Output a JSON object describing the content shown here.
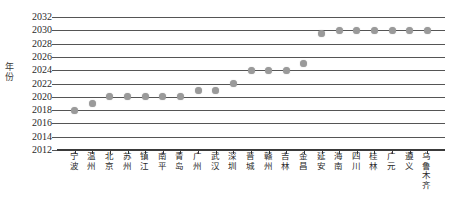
{
  "chart_data": {
    "type": "scatter",
    "title": "",
    "xlabel": "",
    "ylabel": "年份",
    "ylim": [
      2012,
      2032
    ],
    "ytick_labels": [
      "2032",
      "2030",
      "2028",
      "2026",
      "2024",
      "2022",
      "2020",
      "2018",
      "2016",
      "2014",
      "2012"
    ],
    "yticks": [
      2032,
      2030,
      2028,
      2026,
      2024,
      2022,
      2020,
      2018,
      2016,
      2014,
      2012
    ],
    "grid": true,
    "legend": "none",
    "marker_color": "#9a9a9a",
    "axis_color": "#555555",
    "categories": [
      "宁波",
      "温州",
      "北京",
      "苏州",
      "镇江",
      "南平",
      "青岛",
      "广州",
      "武汉",
      "深圳",
      "晋城",
      "赣州",
      "吉林",
      "金昌",
      "延安",
      "海南",
      "四川",
      "桂林",
      "广元",
      "遵义",
      "乌鲁木齐"
    ],
    "values": [
      2018,
      2019,
      2020,
      2020,
      2020,
      2020,
      2020,
      2021,
      2021,
      2022,
      2024,
      2024,
      2024,
      2025,
      2029.5,
      2030,
      2030,
      2030,
      2030,
      2030,
      2030
    ]
  }
}
